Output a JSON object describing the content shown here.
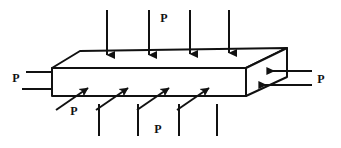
{
  "figure": {
    "name": "rectangular-block-under-uniform-pressure",
    "background_color": "#ffffff",
    "stroke_color": "#111111",
    "fill_color": "#ffffff",
    "canvas": {
      "width": 341,
      "height": 148
    }
  },
  "labels": {
    "top": "P",
    "left": "P",
    "right": "P",
    "front_upper": "P",
    "front_lower": "P"
  },
  "geometry": {
    "front_top_left": {
      "x": 52,
      "y": 68
    },
    "front_top_right": {
      "x": 246,
      "y": 68
    },
    "front_bottom_left": {
      "x": 52,
      "y": 96
    },
    "front_bottom_right": {
      "x": 246,
      "y": 96
    },
    "back_top_left": {
      "x": 80,
      "y": 51
    },
    "back_top_right": {
      "x": 287,
      "y": 48
    },
    "back_bottom_right": {
      "x": 287,
      "y": 77
    }
  },
  "arrows": {
    "top_face": {
      "direction": "down",
      "count": 4,
      "label": "P",
      "shafts_x": [
        107,
        149,
        190,
        229
      ],
      "tail_y": 10,
      "head_y": 61
    },
    "front_face": {
      "direction": "up-right-diagonal",
      "count": 4,
      "label": "P",
      "tails": [
        {
          "x": 60,
          "y": 108
        },
        {
          "x": 100,
          "y": 108
        },
        {
          "x": 140,
          "y": 108
        },
        {
          "x": 180,
          "y": 108
        }
      ],
      "heads": [
        {
          "x": 95,
          "y": 84
        },
        {
          "x": 135,
          "y": 84
        },
        {
          "x": 175,
          "y": 84
        },
        {
          "x": 215,
          "y": 84
        }
      ]
    },
    "right_face": {
      "direction": "left",
      "count": 2,
      "label": "P",
      "rows": [
        {
          "tail_x": 312,
          "head_x": 262,
          "y": 72
        },
        {
          "tail_x": 312,
          "head_x": 254,
          "y": 85
        }
      ]
    },
    "left_side": {
      "direction": "right",
      "count": 2,
      "label": "P",
      "rows": [
        {
          "tail_x": 28,
          "head_x": 52,
          "y": 72
        },
        {
          "tail_x": 24,
          "head_x": 52,
          "y": 89
        }
      ]
    },
    "bottom_guides": {
      "count": 4,
      "shafts_x": [
        99,
        138,
        179,
        217
      ],
      "top_y": 104,
      "bottom_y": 136
    }
  }
}
